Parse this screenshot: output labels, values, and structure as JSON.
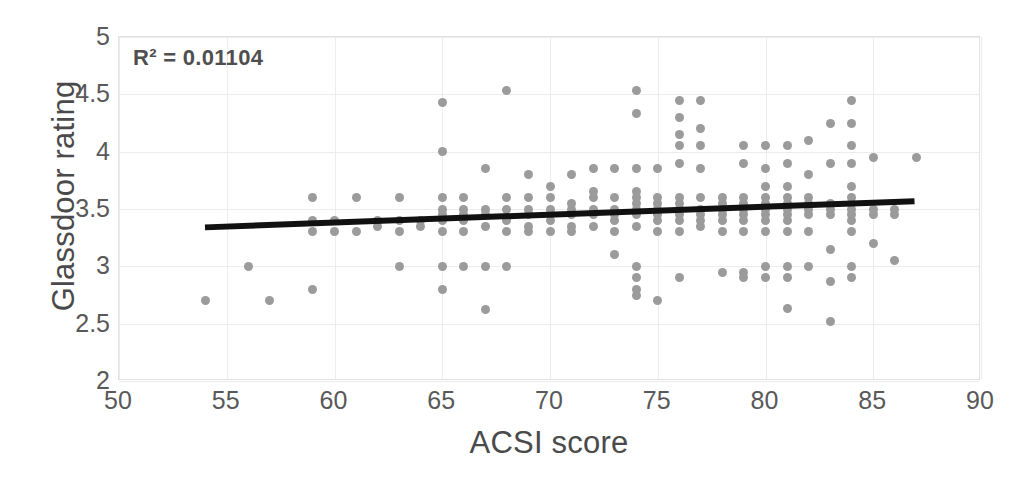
{
  "chart_data": {
    "type": "scatter",
    "title": "",
    "xlabel": "ACSI score",
    "ylabel": "Glassdoor rating",
    "xlim": [
      50,
      90
    ],
    "ylim": [
      2,
      5
    ],
    "xticks": [
      50,
      55,
      60,
      65,
      70,
      75,
      80,
      85,
      90
    ],
    "yticks": [
      2,
      2.5,
      3,
      3.5,
      4,
      4.5,
      5
    ],
    "grid": true,
    "legend": false,
    "annotation": "R² = 0.01104",
    "r_squared": 0.01104,
    "marker_color": "#9b9b9b",
    "trendline_color": "#111111",
    "trendline": {
      "x0": 54,
      "y0": 3.33,
      "x1": 87,
      "y1": 3.56
    },
    "points": [
      [
        54,
        2.7
      ],
      [
        56,
        3.0
      ],
      [
        57,
        2.7
      ],
      [
        59,
        3.6
      ],
      [
        59,
        3.4
      ],
      [
        59,
        3.3
      ],
      [
        59,
        2.8
      ],
      [
        60,
        3.4
      ],
      [
        60,
        3.3
      ],
      [
        61,
        3.6
      ],
      [
        61,
        3.3
      ],
      [
        62,
        3.4
      ],
      [
        62,
        3.35
      ],
      [
        63,
        3.6
      ],
      [
        63,
        3.4
      ],
      [
        63,
        3.3
      ],
      [
        63,
        3.0
      ],
      [
        64,
        3.4
      ],
      [
        64,
        3.35
      ],
      [
        65,
        4.43
      ],
      [
        65,
        4.0
      ],
      [
        65,
        3.6
      ],
      [
        65,
        3.5
      ],
      [
        65,
        3.45
      ],
      [
        65,
        3.4
      ],
      [
        65,
        3.3
      ],
      [
        65,
        3.0
      ],
      [
        65,
        2.8
      ],
      [
        66,
        3.6
      ],
      [
        66,
        3.5
      ],
      [
        66,
        3.45
      ],
      [
        66,
        3.4
      ],
      [
        66,
        3.3
      ],
      [
        66,
        3.0
      ],
      [
        67,
        3.85
      ],
      [
        67,
        3.5
      ],
      [
        67,
        3.45
      ],
      [
        67,
        3.35
      ],
      [
        67,
        3.0
      ],
      [
        67,
        2.62
      ],
      [
        68,
        4.53
      ],
      [
        68,
        3.6
      ],
      [
        68,
        3.5
      ],
      [
        68,
        3.4
      ],
      [
        68,
        3.3
      ],
      [
        68,
        3.0
      ],
      [
        69,
        3.8
      ],
      [
        69,
        3.6
      ],
      [
        69,
        3.5
      ],
      [
        69,
        3.45
      ],
      [
        69,
        3.35
      ],
      [
        69,
        3.3
      ],
      [
        70,
        3.7
      ],
      [
        70,
        3.6
      ],
      [
        70,
        3.5
      ],
      [
        70,
        3.45
      ],
      [
        70,
        3.4
      ],
      [
        70,
        3.3
      ],
      [
        71,
        3.8
      ],
      [
        71,
        3.55
      ],
      [
        71,
        3.5
      ],
      [
        71,
        3.45
      ],
      [
        71,
        3.35
      ],
      [
        71,
        3.3
      ],
      [
        72,
        3.85
      ],
      [
        72,
        3.65
      ],
      [
        72,
        3.6
      ],
      [
        72,
        3.5
      ],
      [
        72,
        3.45
      ],
      [
        72,
        3.35
      ],
      [
        73,
        3.85
      ],
      [
        73,
        3.6
      ],
      [
        73,
        3.5
      ],
      [
        73,
        3.45
      ],
      [
        73,
        3.4
      ],
      [
        73,
        3.3
      ],
      [
        73,
        3.1
      ],
      [
        74,
        4.53
      ],
      [
        74,
        4.33
      ],
      [
        74,
        3.85
      ],
      [
        74,
        3.65
      ],
      [
        74,
        3.6
      ],
      [
        74,
        3.55
      ],
      [
        74,
        3.5
      ],
      [
        74,
        3.45
      ],
      [
        74,
        3.35
      ],
      [
        74,
        3.0
      ],
      [
        74,
        2.9
      ],
      [
        74,
        2.8
      ],
      [
        74,
        2.75
      ],
      [
        75,
        3.85
      ],
      [
        75,
        3.6
      ],
      [
        75,
        3.55
      ],
      [
        75,
        3.5
      ],
      [
        75,
        3.45
      ],
      [
        75,
        3.4
      ],
      [
        75,
        3.3
      ],
      [
        75,
        2.7
      ],
      [
        76,
        4.45
      ],
      [
        76,
        4.3
      ],
      [
        76,
        4.15
      ],
      [
        76,
        4.05
      ],
      [
        76,
        3.9
      ],
      [
        76,
        3.6
      ],
      [
        76,
        3.55
      ],
      [
        76,
        3.5
      ],
      [
        76,
        3.45
      ],
      [
        76,
        3.4
      ],
      [
        76,
        3.3
      ],
      [
        76,
        2.9
      ],
      [
        77,
        4.45
      ],
      [
        77,
        4.2
      ],
      [
        77,
        4.05
      ],
      [
        77,
        3.85
      ],
      [
        77,
        3.6
      ],
      [
        77,
        3.5
      ],
      [
        77,
        3.45
      ],
      [
        77,
        3.4
      ],
      [
        77,
        3.35
      ],
      [
        78,
        3.6
      ],
      [
        78,
        3.55
      ],
      [
        78,
        3.5
      ],
      [
        78,
        3.45
      ],
      [
        78,
        3.4
      ],
      [
        78,
        3.3
      ],
      [
        78,
        2.95
      ],
      [
        79,
        4.05
      ],
      [
        79,
        3.9
      ],
      [
        79,
        3.6
      ],
      [
        79,
        3.55
      ],
      [
        79,
        3.5
      ],
      [
        79,
        3.45
      ],
      [
        79,
        3.4
      ],
      [
        79,
        3.3
      ],
      [
        79,
        2.95
      ],
      [
        79,
        2.9
      ],
      [
        80,
        4.05
      ],
      [
        80,
        3.85
      ],
      [
        80,
        3.7
      ],
      [
        80,
        3.6
      ],
      [
        80,
        3.55
      ],
      [
        80,
        3.5
      ],
      [
        80,
        3.45
      ],
      [
        80,
        3.4
      ],
      [
        80,
        3.3
      ],
      [
        80,
        3.0
      ],
      [
        80,
        2.9
      ],
      [
        81,
        4.05
      ],
      [
        81,
        3.9
      ],
      [
        81,
        3.7
      ],
      [
        81,
        3.6
      ],
      [
        81,
        3.55
      ],
      [
        81,
        3.5
      ],
      [
        81,
        3.45
      ],
      [
        81,
        3.4
      ],
      [
        81,
        3.3
      ],
      [
        81,
        3.0
      ],
      [
        81,
        2.9
      ],
      [
        81,
        2.63
      ],
      [
        82,
        4.1
      ],
      [
        82,
        3.8
      ],
      [
        82,
        3.6
      ],
      [
        82,
        3.55
      ],
      [
        82,
        3.5
      ],
      [
        82,
        3.45
      ],
      [
        82,
        3.3
      ],
      [
        82,
        3.0
      ],
      [
        83,
        4.25
      ],
      [
        83,
        3.9
      ],
      [
        83,
        3.55
      ],
      [
        83,
        3.5
      ],
      [
        83,
        3.45
      ],
      [
        83,
        3.15
      ],
      [
        83,
        2.87
      ],
      [
        83,
        2.52
      ],
      [
        84,
        4.45
      ],
      [
        84,
        4.25
      ],
      [
        84,
        4.05
      ],
      [
        84,
        3.9
      ],
      [
        84,
        3.7
      ],
      [
        84,
        3.6
      ],
      [
        84,
        3.55
      ],
      [
        84,
        3.5
      ],
      [
        84,
        3.45
      ],
      [
        84,
        3.4
      ],
      [
        84,
        3.3
      ],
      [
        84,
        3.0
      ],
      [
        84,
        2.9
      ],
      [
        85,
        3.95
      ],
      [
        85,
        3.5
      ],
      [
        85,
        3.45
      ],
      [
        85,
        3.2
      ],
      [
        86,
        3.5
      ],
      [
        86,
        3.45
      ],
      [
        86,
        3.05
      ],
      [
        87,
        3.95
      ]
    ]
  }
}
